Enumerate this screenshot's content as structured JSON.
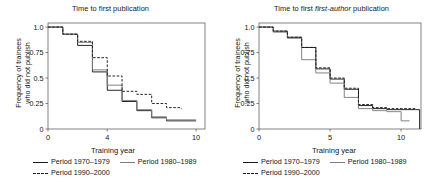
{
  "figure": {
    "width": 442,
    "height": 187,
    "background": "#ffffff"
  },
  "colors": {
    "period_1970_1979": "#1a1a1a",
    "period_1980_1989": "#7d7d7d",
    "period_1990_2000": "#1a1a1a",
    "axis": "#4d4d4d",
    "text": "#151515"
  },
  "legend": {
    "entries": [
      {
        "label": "Period 1970–1979",
        "style": "solid",
        "color": "#1a1a1a"
      },
      {
        "label": "Period 1980–1989",
        "style": "solid",
        "color": "#7d7d7d"
      },
      {
        "label": "Period 1990–2000",
        "style": "dashed",
        "color": "#1a1a1a"
      }
    ]
  },
  "panels": [
    {
      "id": "time-to-first-publication",
      "title_prefix": "Time to first publication",
      "title_italic": "",
      "title_suffix": "",
      "xlabel": "Training year",
      "ylabel_line1": "Frequency of trainees",
      "ylabel_line2": "who did not publish"
    },
    {
      "id": "time-to-first-first-author-publication",
      "title_prefix": "Time to first ",
      "title_italic": "first-author",
      "title_suffix": " publication",
      "xlabel": "Training year",
      "ylabel_line1": "Frequency of trainees",
      "ylabel_line2": "who did not publish"
    }
  ],
  "chart_data": [
    {
      "type": "line",
      "subtype": "step-survival",
      "title": "Time to first publication",
      "xlabel": "Training year",
      "ylabel": "Frequency of trainees who did not publish",
      "xlim": [
        0,
        10.6
      ],
      "ylim": [
        0,
        1.04
      ],
      "xticks": [
        0,
        4,
        10
      ],
      "xticklabels": [
        "0",
        "4",
        "10"
      ],
      "yticks": [
        0,
        0.25,
        0.5,
        0.75,
        1.0
      ],
      "yticklabels": [
        "0",
        "0.25",
        "0.5",
        "0.75",
        "1.0"
      ],
      "grid": false,
      "legend_position": "below",
      "series": [
        {
          "name": "Period 1970–1979",
          "style": "solid",
          "color": "#1a1a1a",
          "x": [
            0,
            1,
            2,
            3,
            4,
            5,
            6,
            7,
            8,
            10
          ],
          "y": [
            1.0,
            0.93,
            0.82,
            0.56,
            0.38,
            0.27,
            0.18,
            0.11,
            0.08,
            0.08
          ]
        },
        {
          "name": "Period 1980–1989",
          "style": "solid",
          "color": "#7d7d7d",
          "x": [
            0,
            1,
            2,
            3,
            4,
            5,
            6,
            7,
            8,
            10
          ],
          "y": [
            1.0,
            0.93,
            0.85,
            0.58,
            0.43,
            0.28,
            0.19,
            0.12,
            0.09,
            0.09
          ]
        },
        {
          "name": "Period 1990–2000",
          "style": "dashed",
          "color": "#1a1a1a",
          "x": [
            0,
            1,
            2,
            3,
            4,
            5,
            6,
            7,
            8,
            9
          ],
          "y": [
            1.0,
            0.93,
            0.86,
            0.7,
            0.52,
            0.37,
            0.34,
            0.25,
            0.21,
            0.2
          ]
        }
      ]
    },
    {
      "type": "line",
      "subtype": "step-survival",
      "title": "Time to first first-author publication",
      "xlabel": "Training year",
      "ylabel": "Frequency of trainees who did not publish",
      "xlim": [
        0,
        11.4
      ],
      "ylim": [
        0,
        1.04
      ],
      "xticks": [
        0,
        5,
        10
      ],
      "xticklabels": [
        "0",
        "5",
        "10"
      ],
      "yticks": [
        0,
        0.25,
        0.5,
        0.75,
        1.0
      ],
      "yticklabels": [
        "0",
        "0.25",
        "0.5",
        "0.75",
        "1.0"
      ],
      "grid": false,
      "legend_position": "below",
      "series": [
        {
          "name": "Period 1970–1979",
          "style": "solid",
          "color": "#1a1a1a",
          "x": [
            0,
            1,
            2,
            3,
            4,
            5,
            6,
            7,
            8,
            9,
            11,
            11.3
          ],
          "y": [
            1.0,
            0.96,
            0.9,
            0.8,
            0.59,
            0.49,
            0.39,
            0.23,
            0.2,
            0.19,
            0.19,
            0.0
          ]
        },
        {
          "name": "Period 1980–1989",
          "style": "solid",
          "color": "#7d7d7d",
          "x": [
            0,
            1,
            2,
            3,
            4,
            5,
            6,
            7,
            8,
            9,
            10,
            10.6
          ],
          "y": [
            1.0,
            0.95,
            0.89,
            0.68,
            0.55,
            0.45,
            0.31,
            0.2,
            0.18,
            0.17,
            0.08,
            0.08
          ]
        },
        {
          "name": "Period 1990–2000",
          "style": "dashed",
          "color": "#1a1a1a",
          "x": [
            0,
            1,
            2,
            3,
            4,
            5,
            6,
            7,
            8,
            9,
            11
          ],
          "y": [
            1.0,
            0.96,
            0.9,
            0.8,
            0.6,
            0.5,
            0.4,
            0.24,
            0.21,
            0.2,
            0.19
          ]
        }
      ]
    }
  ]
}
